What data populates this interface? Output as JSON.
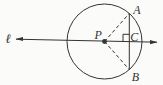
{
  "colors": {
    "stroke": "#333333",
    "background": "#fbfbf9"
  },
  "labels": {
    "line": "ℓ",
    "center": "P",
    "point_a": "A",
    "point_b": "B",
    "point_c": "C"
  }
}
